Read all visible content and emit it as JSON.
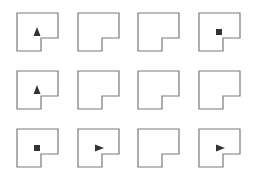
{
  "diagram": {
    "type": "grid-of-notched-squares",
    "rows": 3,
    "cols": 4,
    "colors": {
      "outline": "#7a7a7a",
      "marker": "#333333",
      "background": "#ffffff"
    },
    "shape_geometry": {
      "width": 41,
      "height": 38,
      "notch_x_offset": 24,
      "notch_y_offset": 25
    },
    "col_x": [
      17,
      78,
      138,
      199
    ],
    "row_y": [
      13,
      71,
      129
    ],
    "cells": [
      {
        "row": 0,
        "col": 0,
        "marker": "triangle-up"
      },
      {
        "row": 0,
        "col": 1,
        "marker": "none"
      },
      {
        "row": 0,
        "col": 2,
        "marker": "none"
      },
      {
        "row": 0,
        "col": 3,
        "marker": "square"
      },
      {
        "row": 1,
        "col": 0,
        "marker": "triangle-up"
      },
      {
        "row": 1,
        "col": 1,
        "marker": "none"
      },
      {
        "row": 1,
        "col": 2,
        "marker": "none"
      },
      {
        "row": 1,
        "col": 3,
        "marker": "none"
      },
      {
        "row": 2,
        "col": 0,
        "marker": "square"
      },
      {
        "row": 2,
        "col": 1,
        "marker": "triangle-right"
      },
      {
        "row": 2,
        "col": 2,
        "marker": "none"
      },
      {
        "row": 2,
        "col": 3,
        "marker": "triangle-right"
      }
    ]
  }
}
